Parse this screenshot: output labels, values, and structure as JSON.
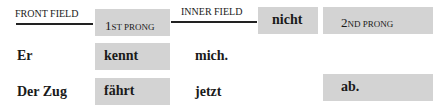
{
  "header": {
    "front_field_label": "FRONT FIELD",
    "first_prong": {
      "big": "1",
      "small": "ST PRONG"
    },
    "inner_field_label": "INNER FIELD",
    "negation": "nicht",
    "second_prong": {
      "big": "2",
      "small": "ND PRONG"
    }
  },
  "rows": [
    {
      "front": "Er",
      "prong1": "kennt",
      "inner": "mich.",
      "prong2": ""
    },
    {
      "front": "Der Zug",
      "prong1": "fährt",
      "inner": "jetzt",
      "prong2": "ab."
    }
  ],
  "colors": {
    "box": "#d3d3d3",
    "line": "#222222",
    "text": "#1a1a1a"
  }
}
